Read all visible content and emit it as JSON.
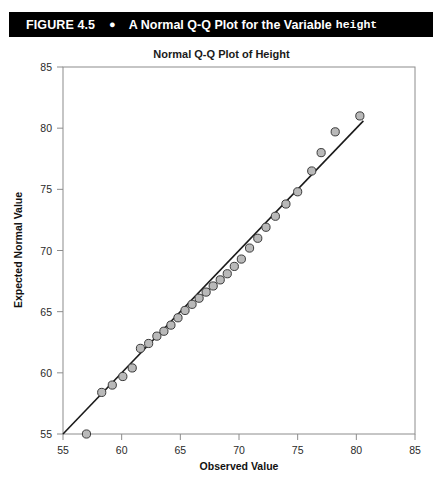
{
  "figure": {
    "number": "FIGURE 4.5",
    "bullet": "●",
    "title": "A Normal Q-Q Plot for the Variable",
    "title_mono": "height"
  },
  "chart_data": {
    "type": "scatter",
    "title": "Normal Q-Q Plot of Height",
    "xlabel": "Observed Value",
    "ylabel": "Expected Normal Value",
    "xlim": [
      55,
      85
    ],
    "ylim": [
      55,
      85
    ],
    "xticks": [
      55,
      60,
      65,
      70,
      75,
      80,
      85
    ],
    "yticks": [
      55,
      60,
      65,
      70,
      75,
      80,
      85
    ],
    "grid": false,
    "legend": "none",
    "marker": {
      "shape": "circle",
      "fill_color": "#b9b9b9",
      "edge_color": "#3a3a3a",
      "radius": 4.1
    },
    "reference_line": {
      "label": "normal reference line",
      "color": "#1a1a1a",
      "x_start": 55.0,
      "y_start": 55.0,
      "x_end": 80.6,
      "y_end": 80.6
    },
    "x": [
      57.0,
      58.3,
      59.2,
      60.1,
      60.9,
      61.6,
      62.3,
      63.0,
      63.6,
      64.2,
      64.8,
      65.4,
      66.0,
      66.6,
      67.2,
      67.8,
      68.4,
      69.0,
      69.6,
      70.2,
      70.9,
      71.6,
      72.3,
      73.1,
      74.0,
      75.0,
      76.2,
      77.0,
      78.2,
      80.3
    ],
    "y": [
      55.0,
      58.4,
      59.0,
      59.7,
      60.4,
      62.0,
      62.4,
      63.0,
      63.4,
      63.9,
      64.5,
      65.1,
      65.6,
      66.1,
      66.6,
      67.1,
      67.6,
      68.1,
      68.7,
      69.3,
      70.2,
      71.0,
      71.9,
      72.8,
      73.8,
      74.8,
      76.5,
      78.0,
      79.7,
      81.0
    ],
    "n_points": 30
  }
}
